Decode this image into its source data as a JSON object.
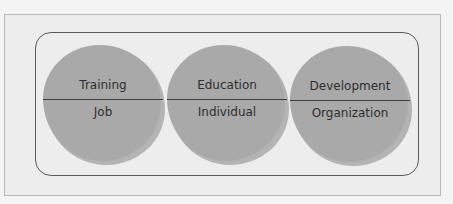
{
  "diagram": {
    "type": "three-circle concept diagram",
    "circles": [
      {
        "top": "Training",
        "bottom": "Job"
      },
      {
        "top": "Education",
        "bottom": "Individual"
      },
      {
        "top": "Development",
        "bottom": "Organization"
      }
    ],
    "colors": {
      "background": "#ededed",
      "circle_fill": "#a9a9a9",
      "circle_halo": "#b4b4b4",
      "frame_border": "#5a5a5a",
      "text": "#2e2e2e"
    }
  }
}
